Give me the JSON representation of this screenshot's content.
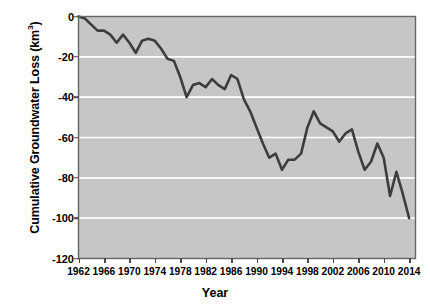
{
  "chart_data": {
    "type": "line",
    "title": "",
    "xlabel": "Year",
    "ylabel": "Cumulative Groundwater Loss (km³)",
    "ylabel_base": "Cumulative Groundwater Loss (km",
    "ylabel_sup": "3",
    "ylabel_close": ")",
    "xlim": [
      1962,
      2015
    ],
    "ylim": [
      -120,
      0
    ],
    "grid": true,
    "legend": false,
    "legend_position": "none",
    "yticks": [
      0,
      -20,
      -40,
      -60,
      -80,
      -100,
      -120
    ],
    "ytick_labels": [
      "0",
      "-20",
      "-40",
      "-60",
      "-80",
      "-100",
      "-120"
    ],
    "xticks": [
      1962,
      1966,
      1970,
      1974,
      1978,
      1982,
      1986,
      1990,
      1994,
      1998,
      2002,
      2006,
      2010,
      2014
    ],
    "xtick_labels": [
      "1962",
      "1966",
      "1970",
      "1974",
      "1978",
      "1982",
      "1986",
      "1990",
      "1994",
      "1998",
      "2002",
      "2006",
      "2010",
      "2014"
    ],
    "series": [
      {
        "name": "Cumulative Groundwater Loss",
        "color": "#3d3d3d",
        "line_width": 2.6,
        "x": [
          1962,
          1963,
          1964,
          1965,
          1966,
          1967,
          1968,
          1969,
          1970,
          1971,
          1972,
          1973,
          1974,
          1975,
          1976,
          1977,
          1978,
          1979,
          1980,
          1981,
          1982,
          1983,
          1984,
          1985,
          1986,
          1987,
          1988,
          1989,
          1990,
          1991,
          1992,
          1993,
          1994,
          1995,
          1996,
          1997,
          1998,
          1999,
          2000,
          2001,
          2002,
          2003,
          2004,
          2005,
          2006,
          2007,
          2008,
          2009,
          2010,
          2011,
          2012,
          2013,
          2014
        ],
        "y": [
          0,
          -1,
          -4,
          -7,
          -7,
          -9,
          -13,
          -9,
          -13,
          -18,
          -12,
          -11,
          -12,
          -16,
          -21,
          -22,
          -30,
          -40,
          -34,
          -33,
          -35,
          -31,
          -34,
          -36,
          -29,
          -31,
          -41,
          -47,
          -55,
          -63,
          -70,
          -68,
          -76,
          -71,
          -71,
          -68,
          -55,
          -47,
          -53,
          -55,
          -57,
          -62,
          -58,
          -56,
          -67,
          -76,
          -72,
          -63,
          -70,
          -89,
          -77,
          -88,
          -100
        ]
      }
    ]
  },
  "plot": {
    "background_color": "#c6c6c6",
    "grid_color": "#ffffff",
    "border_color": "#666666",
    "axis_color": "#4a4a4a",
    "page_background": "#ffffff"
  }
}
